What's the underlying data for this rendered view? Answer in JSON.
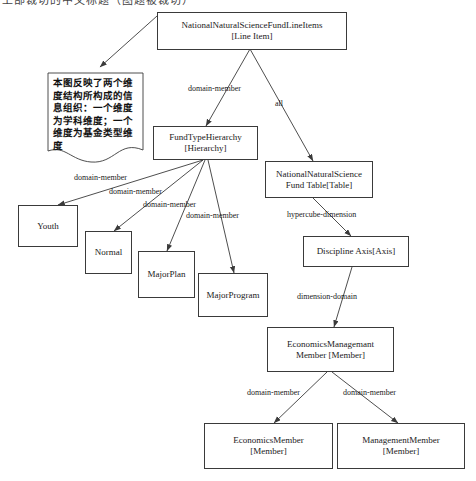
{
  "diagram": {
    "title_partial": "上部裁切的中文标题（图题被裁切）",
    "colors": {
      "stroke": "#3a3a3a",
      "text": "#1a1a1a",
      "background": "#ffffff"
    },
    "nodes": [
      {
        "id": "line-items",
        "name": "NationalNaturalScienceFundLineItems",
        "stereotype": "[Line Item]",
        "label": "NationalNaturalScienceFundLineItems\n[Line Item]"
      },
      {
        "id": "fund-type-hierarchy",
        "name": "FundTypeHierarchy",
        "stereotype": "[Hierarchy]",
        "label": "FundTypeHierarchy\n[Hierarchy]"
      },
      {
        "id": "fund-table",
        "name": "NationalNaturalScience Fund Table",
        "stereotype": "[Table]",
        "label": "NationalNaturalScience\nFund Table[Table]"
      },
      {
        "id": "youth",
        "name": "Youth",
        "stereotype": "",
        "label": "Youth"
      },
      {
        "id": "normal",
        "name": "Normal",
        "stereotype": "",
        "label": "Normal"
      },
      {
        "id": "major-plan",
        "name": "MajorPlan",
        "stereotype": "",
        "label": "MajorPlan"
      },
      {
        "id": "major-program",
        "name": "MajorProgram",
        "stereotype": "",
        "label": "MajorProgram"
      },
      {
        "id": "discipline-axis",
        "name": "Discipline Axis",
        "stereotype": "[Axis]",
        "label": "Discipline Axis[Axis]"
      },
      {
        "id": "economics-management-member",
        "name": "EconomicsManagemant Member",
        "stereotype": "[Member]",
        "label": "EconomicsManagemant\nMember [Member]"
      },
      {
        "id": "economics-member",
        "name": "EconomicsMember",
        "stereotype": "[Member]",
        "label": "EconomicsMember\n[Member]"
      },
      {
        "id": "management-member",
        "name": "ManagementMember",
        "stereotype": "[Member]",
        "label": "ManagementMember\n[Member]"
      }
    ],
    "edge_labels": [
      {
        "id": "e1",
        "text": "domain-member",
        "from": "line-items",
        "to": "fund-type-hierarchy"
      },
      {
        "id": "e2",
        "text": "all",
        "from": "line-items",
        "to": "fund-table"
      },
      {
        "id": "e3",
        "text": "domain-member",
        "from": "fund-type-hierarchy",
        "to": "youth"
      },
      {
        "id": "e4",
        "text": "domain-member",
        "from": "fund-type-hierarchy",
        "to": "normal"
      },
      {
        "id": "e5",
        "text": "domain-member",
        "from": "fund-type-hierarchy",
        "to": "major-plan"
      },
      {
        "id": "e6",
        "text": "domain-member",
        "from": "fund-type-hierarchy",
        "to": "major-program"
      },
      {
        "id": "e7",
        "text": "hypercube-dimension",
        "from": "fund-table",
        "to": "discipline-axis"
      },
      {
        "id": "e8",
        "text": "dimension-domain",
        "from": "discipline-axis",
        "to": "economics-management-member"
      },
      {
        "id": "e9",
        "text": "domain-member",
        "from": "economics-management-member",
        "to": "economics-member"
      },
      {
        "id": "e10",
        "text": "domain-member",
        "from": "economics-management-member",
        "to": "management-member"
      }
    ],
    "note": {
      "id": "annotation-note",
      "text": "本图反映了两个维度结构所构成的信息组织：一个维度为学科维度；一个维度为基金类型维度"
    }
  }
}
